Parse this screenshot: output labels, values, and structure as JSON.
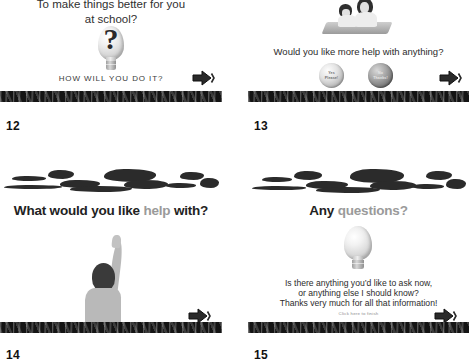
{
  "document": {
    "kind": "powerpoint-handout",
    "layout": "2x2 slide grid",
    "colors": {
      "ink": "#1a1a1a",
      "muted_heading": "#9a9a9a",
      "band": "#141414",
      "paper": "#ffffff"
    }
  },
  "slides": [
    {
      "number": "12",
      "heading_line1": "To make things better for you",
      "heading_line2": "at school?",
      "caption": "HOW WILL YOU DO IT?",
      "icon": "lightbulb-question-icon",
      "next_label": "next"
    },
    {
      "number": "13",
      "prompt": "Would you like more help with anything?",
      "icon": "two-people-reading-icon",
      "buttons": [
        {
          "name": "yes-please-button",
          "line1": "Yes",
          "line2": "Please!"
        },
        {
          "name": "no-thanks-button",
          "line1": "No",
          "line2": "Thanks!"
        }
      ],
      "next_label": "next"
    },
    {
      "number": "14",
      "title_part1": "What would you like ",
      "title_highlight": "help",
      "title_part2": " with?",
      "icon": "child-raising-hand-icon",
      "next_label": "next"
    },
    {
      "number": "15",
      "title_part1": "Any ",
      "title_highlight": "questions?",
      "icon": "lightbulb-icon",
      "body_line1": "Is there anything you’d like to ask now,",
      "body_line2": "or anything else I should know?",
      "body_line3": "Thanks very much for all that information!",
      "footnote": "Click here to finish",
      "next_label": "next"
    }
  ]
}
